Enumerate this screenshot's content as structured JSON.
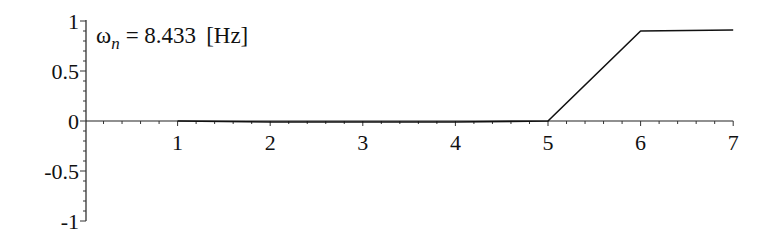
{
  "chart_data": {
    "type": "line",
    "title": "",
    "xlabel": "",
    "ylabel": "",
    "xlim": [
      0,
      7
    ],
    "ylim": [
      -1,
      1
    ],
    "grid": false,
    "legend": null,
    "x_ticks": [
      "1",
      "2",
      "3",
      "4",
      "5",
      "6",
      "7"
    ],
    "y_ticks": [
      "1",
      "0.5",
      "0",
      "-0.5",
      "-1"
    ],
    "annotation": {
      "symbol": "ω",
      "subscript": "n",
      "text": "= 8.433",
      "unit": "[Hz]"
    },
    "series": [
      {
        "name": "response",
        "x": [
          1,
          2,
          3,
          4,
          5,
          6,
          7
        ],
        "y": [
          0.0,
          -0.01,
          -0.01,
          -0.01,
          0.0,
          0.9,
          0.91
        ]
      }
    ]
  }
}
